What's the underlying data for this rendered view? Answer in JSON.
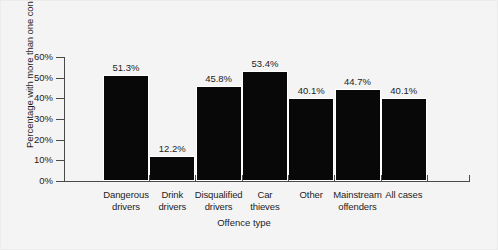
{
  "chart_data": {
    "type": "bar",
    "title": "",
    "xlabel": "Offence type",
    "ylabel": "Percentage with more than one conviction",
    "categories": [
      "Dangerous drivers",
      "Drink drivers",
      "Disqualified drivers",
      "Car thieves",
      "Other",
      "Mainstream offenders",
      "All cases"
    ],
    "category_lines": [
      [
        "Dangerous",
        "drivers"
      ],
      [
        "Drink",
        "drivers"
      ],
      [
        "Disqualified",
        "drivers"
      ],
      [
        "Car",
        "thieves"
      ],
      [
        "Other",
        ""
      ],
      [
        "Mainstream",
        "offenders"
      ],
      [
        "All cases",
        ""
      ]
    ],
    "values": [
      51.3,
      12.2,
      45.8,
      53.4,
      40.1,
      44.7,
      40.1
    ],
    "value_labels": [
      "51.3%",
      "12.2%",
      "45.8%",
      "53.4%",
      "40.1%",
      "44.7%",
      "40.1%"
    ],
    "ylim": [
      0,
      60
    ],
    "ytick_values": [
      60,
      50,
      40,
      30,
      20,
      10,
      0
    ],
    "ytick_labels": [
      "60%",
      "50%",
      "40%",
      "30%",
      "20%",
      "10%",
      "0%"
    ],
    "grid": false,
    "legend": null,
    "bar_color": "#080808",
    "axis_color": "#4a4a4a",
    "background_color": "#f4f4f4"
  }
}
